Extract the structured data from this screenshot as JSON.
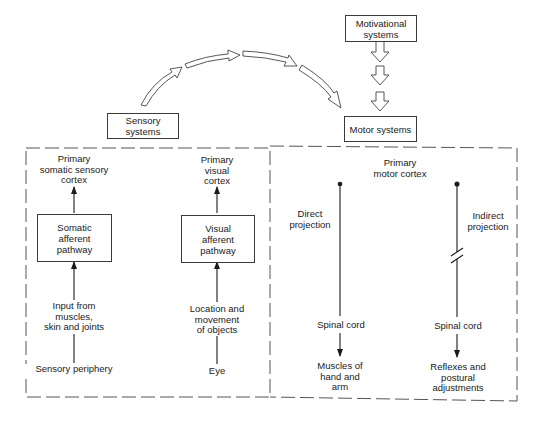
{
  "top": {
    "motivational": "Motivational\nsystems",
    "sensory": "Sensory systems",
    "motor": "Motor systems"
  },
  "sensory_panel": {
    "somatic": {
      "target": "Primary\nsomatic sensory\ncortex",
      "pathway": "Somatic\nafferent\npathway",
      "input": "Input from\nmuscles,\nskin and joints",
      "source": "Sensory periphery"
    },
    "visual": {
      "target": "Primary\nvisual\ncortex",
      "pathway": "Visual\nafferent\npathway",
      "input": "Location and\nmovement\nof objects",
      "source": "Eye"
    }
  },
  "motor_panel": {
    "title": "Primary\nmotor cortex",
    "direct": {
      "label": "Direct\nprojection",
      "relay": "Spinal cord",
      "target": "Muscles of\nhand and\narm"
    },
    "indirect": {
      "label": "Indirect\nprojection",
      "relay": "Spinal cord",
      "target": "Reflexes and\npostural\nadjustments"
    }
  },
  "colors": {
    "line": "#2a2a2a",
    "dash": "#555555",
    "background": "#ffffff"
  }
}
